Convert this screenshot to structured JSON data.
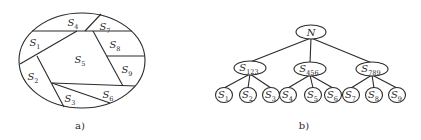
{
  "figure_a": {
    "caption": "a)",
    "regions": [
      {
        "id": "S1",
        "base": "S",
        "sub": "1"
      },
      {
        "id": "S2",
        "base": "S",
        "sub": "2"
      },
      {
        "id": "S3",
        "base": "S",
        "sub": "3"
      },
      {
        "id": "S4",
        "base": "S",
        "sub": "4"
      },
      {
        "id": "S5",
        "base": "S",
        "sub": "5"
      },
      {
        "id": "S6",
        "base": "S",
        "sub": "6"
      },
      {
        "id": "S7",
        "base": "S",
        "sub": "7"
      },
      {
        "id": "S8",
        "base": "S",
        "sub": "8"
      },
      {
        "id": "S9",
        "base": "S",
        "sub": "9"
      }
    ]
  },
  "figure_b": {
    "caption": "b)",
    "root": {
      "base": "N",
      "sub": ""
    },
    "groups": [
      {
        "base": "S",
        "sub": "123",
        "children": [
          {
            "base": "S",
            "sub": "1"
          },
          {
            "base": "S",
            "sub": "2"
          },
          {
            "base": "S",
            "sub": "3"
          }
        ]
      },
      {
        "base": "S",
        "sub": "456",
        "children": [
          {
            "base": "S",
            "sub": "4"
          },
          {
            "base": "S",
            "sub": "5"
          },
          {
            "base": "S",
            "sub": "6"
          }
        ]
      },
      {
        "base": "S",
        "sub": "789",
        "children": [
          {
            "base": "S",
            "sub": "7"
          },
          {
            "base": "S",
            "sub": "8"
          },
          {
            "base": "S",
            "sub": "9"
          }
        ]
      }
    ]
  }
}
